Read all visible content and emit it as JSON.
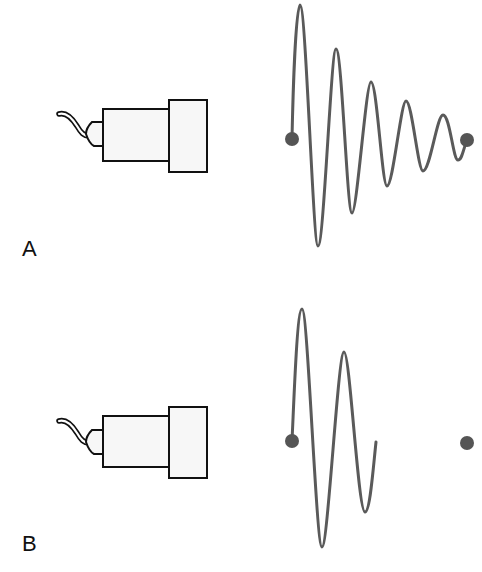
{
  "panels": [
    {
      "label": "A",
      "description": "Transducer with long ringing (undamped) pulse",
      "transducer": {
        "cable": true,
        "connector": true,
        "body": true,
        "backing_block": true
      },
      "waveform": {
        "type": "damped-oscillation",
        "start_marker": true,
        "end_marker": true,
        "cycles": 5
      }
    },
    {
      "label": "B",
      "description": "Transducer with short damped pulse",
      "transducer": {
        "cable": true,
        "connector": true,
        "body": true,
        "backing_block": true
      },
      "waveform": {
        "type": "short-pulse",
        "start_marker": true,
        "end_marker": true,
        "cycles": 2
      }
    }
  ],
  "colors": {
    "waveform": "#5a5a5a",
    "marker": "#555555",
    "outline": "#111111",
    "fill": "#f7f7f7"
  }
}
